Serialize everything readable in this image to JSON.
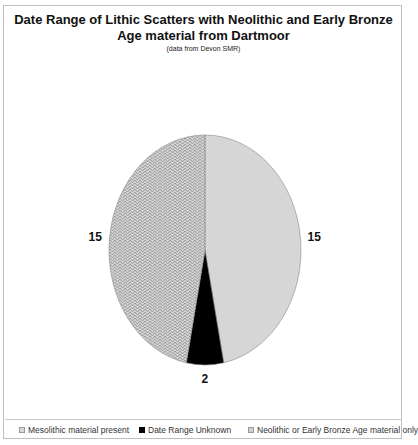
{
  "chart_data": {
    "type": "pie",
    "title": "Date Range of Lithic Scatters with Neolithic and Early Bronze Age material from Dartmoor",
    "title_lines": [
      "Date Range of Lithic Scatters with Neolithic and Early Bronze",
      "Age material from Dartmoor"
    ],
    "subtitle": "(data from Devon SMR)",
    "categories": [
      "Mesolithic material present",
      "Date Range Unknown",
      "Neolithic or Early Bronze Age material only"
    ],
    "values": [
      15,
      2,
      15
    ],
    "data_labels": [
      "15",
      "2",
      "15"
    ],
    "colors": [
      "#d6d6d6",
      "#000000",
      "#c8c8c8"
    ],
    "patterns": [
      "solid-light-gray",
      "solid-black",
      "zigzag-gray"
    ],
    "legend_position": "bottom",
    "start_angle_deg": 0,
    "direction": "clockwise"
  },
  "legend": {
    "items": [
      {
        "label": "Mesolithic material present"
      },
      {
        "label": "Date Range Unknown"
      },
      {
        "label": "Neolithic or Early Bronze Age material only"
      }
    ]
  }
}
